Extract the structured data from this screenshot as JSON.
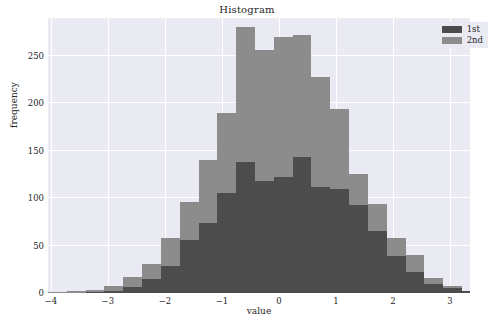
{
  "chart_data": {
    "type": "bar",
    "subtype": "histogram-overlay",
    "title": "Histogram",
    "xlabel": "value",
    "ylabel": "frequency",
    "xlim": [
      -4.05,
      3.35
    ],
    "ylim": [
      0,
      290
    ],
    "grid": true,
    "legend_position": "upper right",
    "xticks": [
      -4,
      -3,
      -2,
      -1,
      0,
      1,
      2,
      3
    ],
    "xtick_labels": [
      "−4",
      "−3",
      "−2",
      "−1",
      "0",
      "1",
      "2",
      "3"
    ],
    "yticks": [
      0,
      50,
      100,
      150,
      200,
      250
    ],
    "ytick_labels": [
      "0",
      "50",
      "100",
      "150",
      "200",
      "250"
    ],
    "bin_edges": [
      -4.05,
      -3.72,
      -3.39,
      -3.06,
      -2.73,
      -2.4,
      -2.07,
      -1.74,
      -1.41,
      -1.08,
      -0.75,
      -0.42,
      -0.09,
      0.24,
      0.57,
      0.9,
      1.23,
      1.56,
      1.89,
      2.22,
      2.55,
      2.88,
      3.21,
      3.35
    ],
    "bin_centers": [
      -3.89,
      -3.56,
      -3.23,
      -2.9,
      -2.57,
      -2.24,
      -1.91,
      -1.58,
      -1.25,
      -0.92,
      -0.59,
      -0.26,
      0.07,
      0.4,
      0.73,
      1.06,
      1.39,
      1.72,
      2.05,
      2.38,
      2.71,
      3.04,
      3.28
    ],
    "series": [
      {
        "name": "1st",
        "color": "#4c4c4c",
        "values": [
          0,
          0,
          1,
          2,
          6,
          15,
          29,
          56,
          74,
          105,
          138,
          118,
          122,
          143,
          112,
          110,
          93,
          65,
          39,
          22,
          10,
          5,
          2
        ]
      },
      {
        "name": "2nd",
        "color": "#8c8c8c",
        "values": [
          1,
          2,
          3,
          7,
          17,
          31,
          58,
          96,
          140,
          190,
          280,
          256,
          270,
          272,
          228,
          194,
          126,
          94,
          58,
          40,
          16,
          7,
          2
        ]
      }
    ]
  },
  "legend": {
    "entries": [
      {
        "label": "1st",
        "color": "#4c4c4c"
      },
      {
        "label": "2nd",
        "color": "#8c8c8c"
      }
    ]
  },
  "style": {
    "axes_background": "#eaeaf2",
    "grid_color": "#ffffff",
    "figure_background": "#ffffff",
    "text_color": "#262626"
  }
}
